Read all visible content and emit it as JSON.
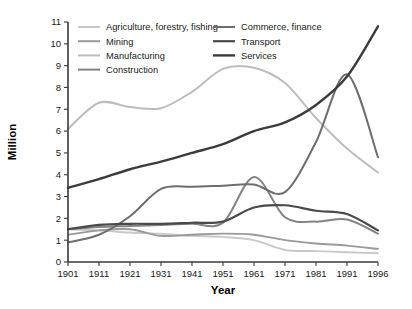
{
  "chart_data": {
    "type": "line",
    "title": "",
    "xlabel": "Year",
    "ylabel": "Million",
    "x": [
      1901,
      1911,
      1921,
      1931,
      1941,
      1951,
      1961,
      1971,
      1981,
      1991,
      1996
    ],
    "xtick_labels": [
      "1901",
      "1911",
      "1921",
      "1931",
      "1941",
      "1951",
      "1961",
      "1971",
      "1981",
      "1991",
      "1996"
    ],
    "ytick_labels": [
      "0",
      "1",
      "2",
      "3",
      "4",
      "5",
      "6",
      "7",
      "8",
      "9",
      "10",
      "11"
    ],
    "ylim": [
      0,
      11
    ],
    "xlim": [
      1901,
      1996
    ],
    "grid": false,
    "legend_position": "top-inside",
    "series": [
      {
        "name": "Agriculture, forestry, fishing",
        "color": "#c9c9c9",
        "width": 1.9,
        "values": [
          1.5,
          1.45,
          1.35,
          1.3,
          1.2,
          1.15,
          1.0,
          0.55,
          0.5,
          0.45,
          0.4
        ]
      },
      {
        "name": "Mining",
        "color": "#9a9a9a",
        "width": 1.9,
        "values": [
          1.25,
          1.45,
          1.5,
          1.2,
          1.25,
          1.3,
          1.25,
          1.0,
          0.85,
          0.75,
          0.6
        ]
      },
      {
        "name": "Manufacturing",
        "color": "#bdbdbd",
        "width": 2.0,
        "values": [
          6.1,
          7.3,
          7.1,
          7.05,
          7.8,
          8.85,
          8.9,
          8.2,
          6.6,
          5.2,
          4.1
        ]
      },
      {
        "name": "Construction",
        "color": "#848484",
        "width": 2.0,
        "values": [
          1.5,
          1.6,
          1.65,
          1.7,
          1.75,
          1.8,
          3.9,
          2.05,
          1.85,
          1.95,
          1.3
        ]
      },
      {
        "name": "Commerce, finance",
        "color": "#6e6e6e",
        "width": 2.0,
        "values": [
          0.9,
          1.25,
          2.1,
          3.35,
          3.45,
          3.5,
          3.55,
          3.2,
          5.5,
          8.6,
          4.8
        ]
      },
      {
        "name": "Transport",
        "color": "#4a4a4a",
        "width": 2.2,
        "values": [
          1.5,
          1.7,
          1.75,
          1.75,
          1.8,
          1.85,
          2.5,
          2.6,
          2.35,
          2.2,
          1.45
        ]
      },
      {
        "name": "Services",
        "color": "#3b3b3b",
        "width": 2.4,
        "values": [
          3.4,
          3.8,
          4.25,
          4.6,
          5.0,
          5.4,
          6.0,
          6.4,
          7.2,
          8.5,
          10.8
        ]
      }
    ]
  }
}
